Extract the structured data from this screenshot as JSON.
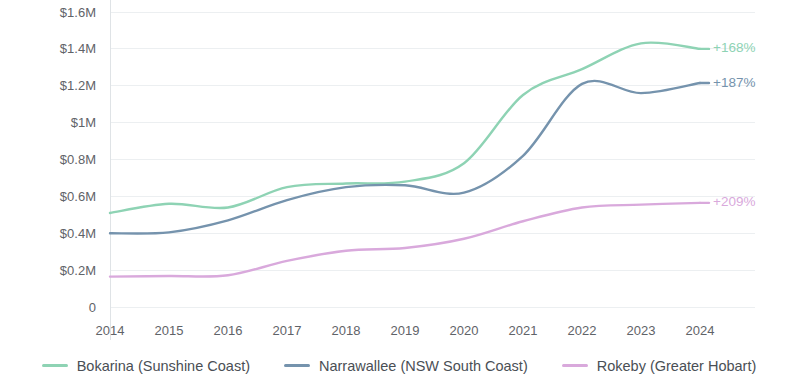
{
  "chart_data": {
    "type": "line",
    "title": "",
    "subtitle": "",
    "xlabel": "",
    "ylabel": "",
    "grid": true,
    "legend_position": "bottom",
    "x": [
      2014,
      2015,
      2016,
      2017,
      2018,
      2019,
      2020,
      2021,
      2022,
      2023,
      2024
    ],
    "categories": [
      "2014",
      "2015",
      "2016",
      "2017",
      "2018",
      "2019",
      "2020",
      "2021",
      "2022",
      "2023",
      "2024"
    ],
    "ylim": [
      0,
      1600000
    ],
    "ytick_values": [
      0,
      200000,
      400000,
      600000,
      800000,
      1000000,
      1200000,
      1400000,
      1600000
    ],
    "ytick_labels": [
      "0",
      "$0.2M",
      "$0.4M",
      "$0.6M",
      "$0.8M",
      "$1M",
      "$1.2M",
      "$1.4M",
      "$1.6M"
    ],
    "series": [
      {
        "name": "Bokarina (Sunshine Coast)",
        "color": "#8ed3b4",
        "end_label": "+168%",
        "values": [
          510000,
          560000,
          540000,
          650000,
          670000,
          680000,
          780000,
          1150000,
          1290000,
          1430000,
          1400000
        ]
      },
      {
        "name": "Narrawallee (NSW South Coast)",
        "color": "#7593ad",
        "end_label": "+187%",
        "values": [
          400000,
          405000,
          470000,
          580000,
          650000,
          660000,
          620000,
          820000,
          1210000,
          1160000,
          1215000
        ]
      },
      {
        "name": "Rokeby (Greater Hobart)",
        "color": "#d9a9dc",
        "end_label": "+209%",
        "values": [
          165000,
          168000,
          172000,
          250000,
          305000,
          320000,
          370000,
          465000,
          540000,
          555000,
          565000
        ]
      }
    ]
  },
  "legend": {
    "items": [
      {
        "label": "Bokarina (Sunshine Coast)",
        "color": "#8ed3b4"
      },
      {
        "label": "Narrawallee (NSW South Coast)",
        "color": "#7593ad"
      },
      {
        "label": "Rokeby (Greater Hobart)",
        "color": "#d9a9dc"
      }
    ]
  }
}
